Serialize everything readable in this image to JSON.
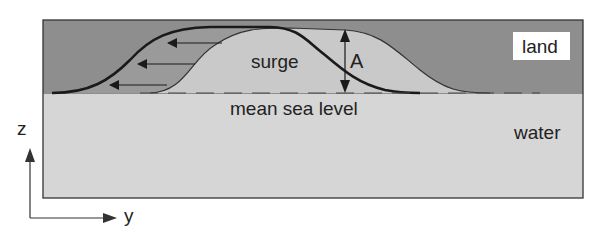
{
  "diagram": {
    "labels": {
      "land": "land",
      "water": "water",
      "surge": "surge",
      "mean_sea_level": "mean sea level",
      "amplitude": "A",
      "axis_z": "z",
      "axis_y": "y"
    },
    "colors": {
      "land": "#8e8e8e",
      "water": "#d6d6d6",
      "surge": "#c9c9c9",
      "curve": "#1a1a1a",
      "frame": "#333333",
      "label_box": "#ffffff"
    },
    "arrows": {
      "flow_direction": "left",
      "count": 3
    }
  }
}
